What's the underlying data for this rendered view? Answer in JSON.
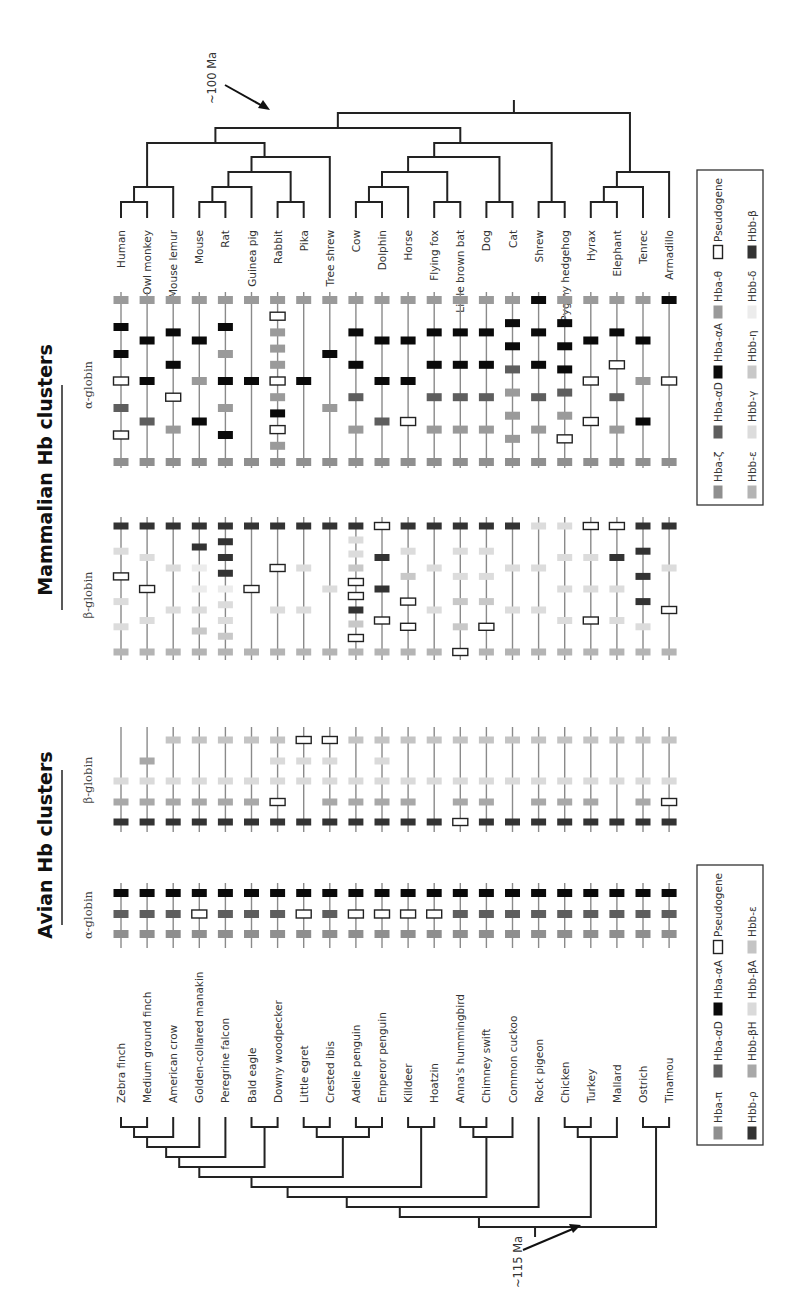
{
  "figure": {
    "orientation": "rotated-90-ccw",
    "mammalian": {
      "title": "Mammalian Hb clusters",
      "alpha_label": "α-globin",
      "beta_label": "β-globin",
      "divergence_label": "~100 Ma",
      "taxa": [
        "Human",
        "Owl monkey",
        "Mouse lemur",
        "Mouse",
        "Rat",
        "Guinea pig",
        "Rabbit",
        "Pika",
        "Tree shrew",
        "Cow",
        "Dolphin",
        "Horse",
        "Flying fox",
        "Little brown bat",
        "Dog",
        "Cat",
        "Shrew",
        "Pygmy hedgehog",
        "Hyrax",
        "Elephant",
        "Tenrec",
        "Armadillo"
      ],
      "legend": [
        {
          "key": "zeta",
          "label": "Hba-ζ",
          "color": "#8f8f8f",
          "type": "fill"
        },
        {
          "key": "alphaD",
          "label": "Hba-αD",
          "color": "#5e5e5e",
          "type": "fill"
        },
        {
          "key": "alphaA",
          "label": "Hba-αA",
          "color": "#0a0a0a",
          "type": "fill"
        },
        {
          "key": "theta",
          "label": "Hba-θ",
          "color": "#9a9a9a",
          "type": "fill"
        },
        {
          "key": "pseudo",
          "label": "Pseudogene",
          "color": "#ffffff",
          "type": "outline"
        },
        {
          "key": "eps",
          "label": "Hbb-ε",
          "color": "#b4b4b4",
          "type": "fill"
        },
        {
          "key": "gamma",
          "label": "Hbb-γ",
          "color": "#dcdcdc",
          "type": "fill"
        },
        {
          "key": "eta",
          "label": "Hbb-η",
          "color": "#c8c8c8",
          "type": "fill"
        },
        {
          "key": "delta",
          "label": "Hbb-δ",
          "color": "#ececec",
          "type": "fill"
        },
        {
          "key": "beta",
          "label": "Hbb-β",
          "color": "#333333",
          "type": "fill"
        }
      ],
      "alpha_clusters": [
        [
          "zeta",
          "pseudo",
          "alphaD",
          "pseudo",
          "alphaA",
          "alphaA",
          "theta"
        ],
        [
          "zeta",
          "alphaD",
          "alphaA",
          "alphaA",
          "theta"
        ],
        [
          "zeta",
          "theta",
          "pseudo",
          "alphaA",
          "alphaA",
          "theta"
        ],
        [
          "zeta",
          "alphaA",
          "theta",
          "alphaA",
          "theta"
        ],
        [
          "zeta",
          "alphaA",
          "theta",
          "alphaA",
          "theta",
          "alphaA",
          "theta"
        ],
        [
          "zeta",
          "alphaA",
          "theta"
        ],
        [
          "zeta",
          "theta",
          "pseudo",
          "alphaA",
          "theta",
          "pseudo",
          "theta",
          "theta",
          "theta",
          "pseudo",
          "theta"
        ],
        [
          "zeta",
          "alphaA",
          "theta"
        ],
        [
          "zeta",
          "theta",
          "alphaA",
          "theta"
        ],
        [
          "zeta",
          "theta",
          "alphaD",
          "alphaA",
          "alphaA",
          "theta"
        ],
        [
          "zeta",
          "alphaD",
          "alphaA",
          "alphaA",
          "theta"
        ],
        [
          "zeta",
          "pseudo",
          "alphaA",
          "alphaA",
          "theta"
        ],
        [
          "zeta",
          "theta",
          "alphaD",
          "alphaA",
          "alphaA",
          "theta"
        ],
        [
          "zeta",
          "theta",
          "alphaD",
          "alphaA",
          "alphaA",
          "theta"
        ],
        [
          "zeta",
          "theta",
          "alphaD",
          "alphaA",
          "alphaA",
          "theta"
        ],
        [
          "zeta",
          "theta",
          "theta",
          "theta",
          "alphaD",
          "alphaA",
          "alphaA",
          "theta"
        ],
        [
          "zeta",
          "theta",
          "alphaD",
          "alphaA",
          "alphaA",
          "alphaA"
        ],
        [
          "zeta",
          "pseudo",
          "theta",
          "alphaD",
          "alphaA",
          "alphaA",
          "alphaA",
          "theta"
        ],
        [
          "zeta",
          "pseudo",
          "pseudo",
          "alphaA",
          "theta"
        ],
        [
          "zeta",
          "theta",
          "alphaD",
          "pseudo",
          "alphaA",
          "theta"
        ],
        [
          "zeta",
          "alphaA",
          "theta",
          "alphaA",
          "theta"
        ],
        [
          "zeta",
          "pseudo",
          "alphaA"
        ]
      ],
      "beta_clusters": [
        [
          "eps",
          "gamma",
          "gamma",
          "pseudo",
          "gamma",
          "beta"
        ],
        [
          "eps",
          "gamma",
          "pseudo",
          "gamma",
          "beta"
        ],
        [
          "eps",
          "gamma",
          "gamma",
          "beta"
        ],
        [
          "eps",
          "eta",
          "gamma",
          "delta",
          "delta",
          "beta",
          "beta"
        ],
        [
          "eps",
          "eta",
          "gamma",
          "gamma",
          "delta",
          "beta",
          "beta",
          "beta",
          "beta"
        ],
        [
          "eps",
          "pseudo",
          "beta"
        ],
        [
          "eps",
          "gamma",
          "pseudo",
          "beta"
        ],
        [
          "eps",
          "gamma",
          "gamma",
          "beta"
        ],
        [
          "eps",
          "gamma",
          "beta"
        ],
        [
          "eps",
          "pseudo",
          "eta",
          "beta",
          "pseudo",
          "pseudo",
          "eta",
          "gamma",
          "gamma",
          "beta"
        ],
        [
          "eps",
          "pseudo",
          "beta",
          "beta",
          "pseudo"
        ],
        [
          "eps",
          "pseudo",
          "pseudo",
          "eta",
          "gamma",
          "beta"
        ],
        [
          "eps",
          "gamma",
          "gamma",
          "beta"
        ],
        [
          "pseudo",
          "eta",
          "eta",
          "gamma",
          "gamma",
          "beta"
        ],
        [
          "eps",
          "pseudo",
          "eta",
          "gamma",
          "gamma",
          "beta"
        ],
        [
          "eps",
          "gamma",
          "gamma",
          "beta"
        ],
        [
          "eps",
          "gamma",
          "gamma",
          "gamma"
        ],
        [
          "eps",
          "gamma",
          "gamma",
          "gamma",
          "gamma"
        ],
        [
          "eps",
          "pseudo",
          "gamma",
          "gamma",
          "pseudo"
        ],
        [
          "eps",
          "gamma",
          "gamma",
          "beta",
          "pseudo"
        ],
        [
          "eps",
          "gamma",
          "beta",
          "beta",
          "beta",
          "beta"
        ],
        [
          "eps",
          "pseudo",
          "gamma",
          "beta"
        ]
      ]
    },
    "avian": {
      "title": "Avian Hb clusters",
      "alpha_label": "α-globin",
      "beta_label": "β-globin",
      "divergence_label": "~115 Ma",
      "taxa": [
        "Zebra finch",
        "Medium ground finch",
        "American crow",
        "Golden-collared manakin",
        "Peregrine falcon",
        "Bald eagle",
        "Downy woodpecker",
        "Little egret",
        "Crested ibis",
        "Adelie penguin",
        "Emperor penguin",
        "Killdeer",
        "Hoatzin",
        "Anna's hummingbird",
        "Chimney swift",
        "Common cuckoo",
        "Rock pigeon",
        "Chicken",
        "Turkey",
        "Mallard",
        "Ostrich",
        "Tinamou"
      ],
      "legend": [
        {
          "key": "pi",
          "label": "Hba-π",
          "color": "#8f8f8f",
          "type": "fill"
        },
        {
          "key": "alphaD",
          "label": "Hba-αD",
          "color": "#5e5e5e",
          "type": "fill"
        },
        {
          "key": "alphaA",
          "label": "Hba-αA",
          "color": "#0a0a0a",
          "type": "fill"
        },
        {
          "key": "pseudo",
          "label": "Pseudogene",
          "color": "#ffffff",
          "type": "outline"
        },
        {
          "key": "rho",
          "label": "Hbb-ρ",
          "color": "#333333",
          "type": "fill"
        },
        {
          "key": "betaH",
          "label": "Hbb-βH",
          "color": "#a8a8a8",
          "type": "fill"
        },
        {
          "key": "betaA",
          "label": "Hbb-βA",
          "color": "#dadada",
          "type": "fill"
        },
        {
          "key": "eps",
          "label": "Hbb-ε",
          "color": "#c4c4c4",
          "type": "fill"
        }
      ],
      "alpha_clusters": [
        [
          "pi",
          "alphaD",
          "alphaA"
        ],
        [
          "pi",
          "alphaD",
          "alphaA"
        ],
        [
          "pi",
          "alphaD",
          "alphaA"
        ],
        [
          "pi",
          "pseudo",
          "alphaA"
        ],
        [
          "pi",
          "alphaD",
          "alphaA"
        ],
        [
          "pi",
          "alphaD",
          "alphaA"
        ],
        [
          "pi",
          "alphaD",
          "alphaA"
        ],
        [
          "pi",
          "pseudo",
          "alphaA"
        ],
        [
          "pi",
          "alphaD",
          "alphaA"
        ],
        [
          "pi",
          "pseudo",
          "alphaA"
        ],
        [
          "pi",
          "pseudo",
          "alphaA"
        ],
        [
          "pi",
          "pseudo",
          "alphaA"
        ],
        [
          "pi",
          "pseudo",
          "alphaA"
        ],
        [
          "pi",
          "alphaD",
          "alphaA"
        ],
        [
          "pi",
          "alphaD",
          "alphaA"
        ],
        [
          "pi",
          "alphaD",
          "alphaA"
        ],
        [
          "pi",
          "alphaD",
          "alphaA"
        ],
        [
          "pi",
          "alphaD",
          "alphaA"
        ],
        [
          "pi",
          "alphaD",
          "alphaA"
        ],
        [
          "pi",
          "alphaD",
          "alphaA"
        ],
        [
          "pi",
          "alphaD",
          "alphaA"
        ],
        [
          "pi",
          "alphaD",
          "alphaA"
        ]
      ],
      "beta_clusters": [
        [
          "rho",
          "betaH",
          "betaA",
          null,
          null
        ],
        [
          "rho",
          "betaH",
          "betaA",
          "betaH",
          null
        ],
        [
          "rho",
          "betaH",
          "betaA",
          null,
          "eps"
        ],
        [
          "rho",
          "betaH",
          "betaA",
          null,
          "eps"
        ],
        [
          "rho",
          "betaH",
          "betaA",
          null,
          "eps"
        ],
        [
          "rho",
          "betaH",
          "betaA",
          null,
          "eps"
        ],
        [
          "rho",
          "pseudo",
          "betaA",
          "betaA",
          "eps"
        ],
        [
          "rho",
          null,
          "betaA",
          "betaA",
          "pseudo"
        ],
        [
          "rho",
          "betaH",
          "betaA",
          "betaA",
          "pseudo"
        ],
        [
          "rho",
          "betaH",
          "betaA",
          null,
          "eps"
        ],
        [
          "rho",
          "betaH",
          "betaA",
          "betaA",
          "eps"
        ],
        [
          "rho",
          "betaH",
          "betaA",
          null,
          "eps"
        ],
        [
          "rho",
          null,
          "betaA",
          null,
          "eps"
        ],
        [
          "pseudo",
          "betaH",
          "betaA",
          null,
          "eps"
        ],
        [
          "rho",
          "betaH",
          "betaA",
          null,
          "eps"
        ],
        [
          "rho",
          null,
          "betaA",
          null,
          "eps"
        ],
        [
          "rho",
          "betaH",
          "betaA",
          null,
          "eps"
        ],
        [
          "rho",
          "betaH",
          "betaA",
          null,
          "eps"
        ],
        [
          "rho",
          "betaH",
          "betaA",
          null,
          "eps"
        ],
        [
          "rho",
          null,
          "betaA",
          null,
          "eps"
        ],
        [
          "rho",
          "betaH",
          "betaA",
          null,
          "eps"
        ],
        [
          "rho",
          "pseudo",
          "betaA",
          null,
          "eps"
        ]
      ]
    }
  }
}
